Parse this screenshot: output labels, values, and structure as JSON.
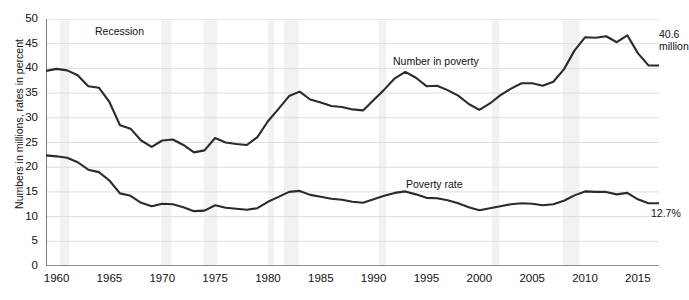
{
  "chart_data": {
    "type": "line",
    "title": "",
    "xlabel": "",
    "ylabel": "Numbers in millions, rates in percent",
    "xlim": [
      1959,
      2017
    ],
    "ylim": [
      0,
      50
    ],
    "ytick_step": 5,
    "grid": true,
    "legend": "inline-annotations",
    "yticks": [
      "0",
      "5",
      "10",
      "15",
      "20",
      "25",
      "30",
      "35",
      "40",
      "45",
      "50"
    ],
    "xticks": [
      "1960",
      "1965",
      "1970",
      "1975",
      "1980",
      "1985",
      "1990",
      "1995",
      "2000",
      "2005",
      "2010",
      "2015"
    ],
    "x": [
      1959,
      1960,
      1961,
      1962,
      1963,
      1964,
      1965,
      1966,
      1967,
      1968,
      1969,
      1970,
      1971,
      1972,
      1973,
      1974,
      1975,
      1976,
      1977,
      1978,
      1979,
      1980,
      1981,
      1982,
      1983,
      1984,
      1985,
      1986,
      1987,
      1988,
      1989,
      1990,
      1991,
      1992,
      1993,
      1994,
      1995,
      1996,
      1997,
      1998,
      1999,
      2000,
      2001,
      2002,
      2003,
      2004,
      2005,
      2006,
      2007,
      2008,
      2009,
      2010,
      2011,
      2012,
      2013,
      2014,
      2015,
      2016,
      2017
    ],
    "series": [
      {
        "name": "Number in poverty",
        "units": "millions",
        "end_value": 40.6,
        "end_label": "40.6 million",
        "annotation": "Number in poverty",
        "color": "#2b2b2b",
        "values": [
          39.5,
          39.9,
          39.6,
          38.6,
          36.4,
          36.1,
          33.2,
          28.5,
          27.8,
          25.4,
          24.1,
          25.4,
          25.6,
          24.5,
          23.0,
          23.4,
          25.9,
          25.0,
          24.7,
          24.5,
          26.1,
          29.3,
          31.8,
          34.4,
          35.3,
          33.7,
          33.1,
          32.4,
          32.2,
          31.7,
          31.5,
          33.6,
          35.7,
          38.0,
          39.3,
          38.1,
          36.4,
          36.5,
          35.6,
          34.5,
          32.8,
          31.6,
          32.9,
          34.6,
          35.9,
          37.0,
          37.0,
          36.5,
          37.3,
          39.8,
          43.6,
          46.3,
          46.2,
          46.5,
          45.3,
          46.7,
          43.1,
          40.6,
          40.6
        ]
      },
      {
        "name": "Poverty rate",
        "units": "percent",
        "end_value": 12.7,
        "end_label": "12.7%",
        "annotation": "Poverty rate",
        "color": "#2b2b2b",
        "values": [
          22.4,
          22.2,
          21.9,
          21.0,
          19.5,
          19.0,
          17.3,
          14.7,
          14.2,
          12.8,
          12.1,
          12.6,
          12.5,
          11.9,
          11.1,
          11.2,
          12.3,
          11.8,
          11.6,
          11.4,
          11.7,
          13.0,
          14.0,
          15.0,
          15.2,
          14.4,
          14.0,
          13.6,
          13.4,
          13.0,
          12.8,
          13.5,
          14.2,
          14.8,
          15.1,
          14.5,
          13.8,
          13.7,
          13.3,
          12.7,
          11.9,
          11.3,
          11.7,
          12.1,
          12.5,
          12.7,
          12.6,
          12.3,
          12.5,
          13.2,
          14.3,
          15.1,
          15.0,
          15.0,
          14.5,
          14.8,
          13.5,
          12.7,
          12.7
        ]
      }
    ],
    "recessions": [
      {
        "start": 1960.3,
        "end": 1961.2
      },
      {
        "start": 1969.9,
        "end": 1970.9
      },
      {
        "start": 1973.9,
        "end": 1975.2
      },
      {
        "start": 1980.0,
        "end": 1980.6
      },
      {
        "start": 1981.5,
        "end": 1982.9
      },
      {
        "start": 1990.5,
        "end": 1991.2
      },
      {
        "start": 2001.2,
        "end": 2001.9
      },
      {
        "start": 2007.9,
        "end": 2009.5
      }
    ],
    "recession_label": "Recession",
    "recession_color": "#f2f2f2",
    "grid_color": "#d9d9d9",
    "axis_color": "#6e6e6e",
    "line_color": "#2b2b2b"
  }
}
